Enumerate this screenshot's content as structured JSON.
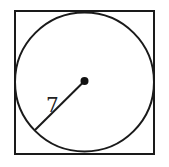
{
  "diagram": {
    "radius_label": "7",
    "colors": {
      "stroke": "#1a1a1a",
      "background": "#ffffff"
    }
  }
}
